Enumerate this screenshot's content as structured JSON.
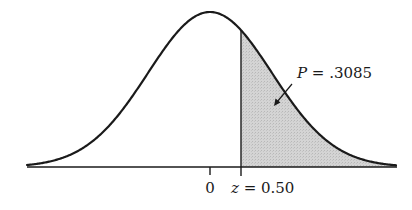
{
  "chart_data": {
    "type": "area",
    "title": "",
    "distribution": "standard normal",
    "mean": 0,
    "sd": 1,
    "shaded_region": {
      "from_z": 0.5,
      "to_z": "infinity",
      "probability": 0.3085
    },
    "x_ticks": [
      {
        "z": 0,
        "label": "0"
      },
      {
        "z": 0.5,
        "label": "z = 0.50"
      }
    ],
    "annotation": {
      "text": "P = .3085",
      "points_to": "shaded-region"
    },
    "xlabel": "",
    "ylabel": "",
    "grid": false,
    "legend": false,
    "colors": {
      "curve": "#1a1a1a",
      "shade": "#cfcfcf",
      "axis": "#1a1a1a"
    }
  },
  "labels": {
    "tick_zero": "0",
    "z_var": "z",
    "z_eq": " = 0.50",
    "p_var": "P",
    "p_eq": " = .3085"
  }
}
